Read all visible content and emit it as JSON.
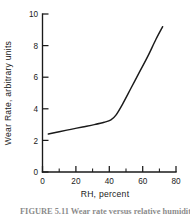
{
  "figure": {
    "caption": "FIGURE 5.11   Wear rate versus relative humidity.",
    "background_color": "#ffffff",
    "line_color": "#1a1a1a"
  },
  "chart_data": {
    "type": "line",
    "title": "",
    "xlabel": "RH, percent",
    "ylabel": "Wear Rate, arbitrary units",
    "xlim": [
      0,
      80
    ],
    "ylim": [
      0,
      10
    ],
    "grid": false,
    "legend": null,
    "x_ticks_major": [
      0,
      20,
      40,
      60,
      80
    ],
    "x_ticks_minor": [
      10,
      30,
      50,
      70
    ],
    "y_ticks_major": [
      0,
      2,
      4,
      6,
      8,
      10
    ],
    "x_tick_labels": [
      "0",
      "20",
      "40",
      "60",
      "80"
    ],
    "y_tick_labels": [
      "0",
      "2",
      "4",
      "6",
      "8",
      "10"
    ],
    "series": [
      {
        "name": "Wear rate",
        "x": [
          3.5,
          10,
          17,
          24,
          31,
          37,
          41,
          44,
          48,
          53,
          58,
          63,
          68,
          72
        ],
        "values": [
          2.4,
          2.55,
          2.7,
          2.85,
          3.0,
          3.15,
          3.3,
          3.6,
          4.3,
          5.3,
          6.3,
          7.3,
          8.4,
          9.2
        ]
      }
    ]
  },
  "axis_labels": {
    "x_title": "RH, percent",
    "y_title": "Wear Rate, arbitrary units"
  }
}
